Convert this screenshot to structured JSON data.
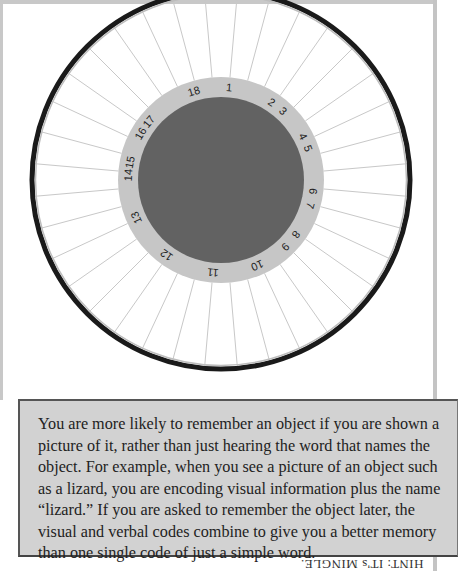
{
  "wheel": {
    "center": {
      "x": 221,
      "y": 180
    },
    "outer_ring_radius": 189,
    "label_ring_outer_radius": 103,
    "center_disk_radius": 83,
    "spoke_count": 36,
    "colors": {
      "outer_ring": "#1a1a1a",
      "spokes": "#c8c8c8",
      "label_ring": "#c6c6c6",
      "center_disk": "#626262",
      "label_text": "#222222"
    },
    "labels": [
      {
        "text": "1",
        "angle": 5
      },
      {
        "text": "2",
        "angle": 33
      },
      {
        "text": "3",
        "angle": 42
      },
      {
        "text": "4",
        "angle": 62
      },
      {
        "text": "5",
        "angle": 70
      },
      {
        "text": "6",
        "angle": 97
      },
      {
        "text": "7",
        "angle": 106
      },
      {
        "text": "8",
        "angle": 126
      },
      {
        "text": "9",
        "angle": 136
      },
      {
        "text": "10",
        "angle": 157
      },
      {
        "text": "11",
        "angle": 185
      },
      {
        "text": "12",
        "angle": 216
      },
      {
        "text": "13",
        "angle": 246
      },
      {
        "text": "14",
        "angle": 273
      },
      {
        "text": "15",
        "angle": 281
      },
      {
        "text": "16",
        "angle": 300
      },
      {
        "text": "17",
        "angle": 309
      },
      {
        "text": "18",
        "angle": 343
      }
    ]
  },
  "info_box": {
    "text": "You are more likely to remember an object if you are shown a picture of it, rather than just hearing the word that names the object. For example, when you see a picture of an object such as a lizard, you are encoding visual information plus the name “lizard.” If you are asked to remember the object later, the visual and verbal codes combine to give you a better memory than one single code of just a simple word."
  },
  "hint": {
    "text": "HINT: IT's MINGLE."
  }
}
